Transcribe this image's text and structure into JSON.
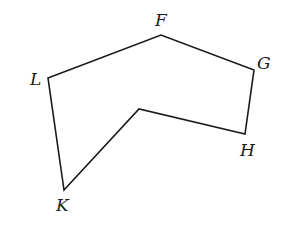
{
  "diagram": {
    "type": "polygon",
    "vertices": [
      {
        "id": "F",
        "label": "F",
        "x": 161,
        "y": 35,
        "label_x": 155,
        "label_y": 26
      },
      {
        "id": "G",
        "label": "G",
        "x": 254,
        "y": 70,
        "label_x": 257,
        "label_y": 69
      },
      {
        "id": "H",
        "label": "H",
        "x": 245,
        "y": 134,
        "label_x": 240,
        "label_y": 156
      },
      {
        "id": "M",
        "label": "",
        "x": 139,
        "y": 109,
        "label_x": 0,
        "label_y": 0
      },
      {
        "id": "K",
        "label": "K",
        "x": 64,
        "y": 190,
        "label_x": 56,
        "label_y": 211
      },
      {
        "id": "L",
        "label": "L",
        "x": 48,
        "y": 78,
        "label_x": 30,
        "label_y": 85
      }
    ],
    "edges": [
      [
        "L",
        "F"
      ],
      [
        "F",
        "G"
      ],
      [
        "G",
        "H"
      ],
      [
        "H",
        "M"
      ],
      [
        "M",
        "K"
      ],
      [
        "K",
        "L"
      ]
    ],
    "labels": {
      "F": "F",
      "G": "G",
      "H": "H",
      "K": "K",
      "L": "L"
    },
    "stroke_color": "#1a1a1a",
    "background_color": "#ffffff"
  }
}
